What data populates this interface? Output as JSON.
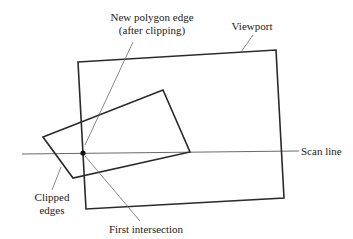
{
  "diagram": {
    "colors": {
      "background": "#ffffff",
      "stroke_heavy": "#2a2a2a",
      "stroke_light": "#6a6a6a",
      "text": "#222222"
    },
    "viewport": {
      "label": "Viewport",
      "corners": [
        [
          78,
          62
        ],
        [
          276,
          50
        ],
        [
          284,
          198
        ],
        [
          86,
          209
        ]
      ]
    },
    "polygon": {
      "vertices": [
        [
          43,
          137
        ],
        [
          163,
          90
        ],
        [
          190,
          152
        ],
        [
          73,
          178
        ]
      ]
    },
    "scan_line": {
      "label": "Scan line",
      "from": [
        22,
        154
      ],
      "to": [
        299,
        151
      ]
    },
    "first_intersection": {
      "label": "First intersection",
      "point": [
        83,
        153
      ]
    },
    "annotations": {
      "new_edge_line1": "New polygon edge",
      "new_edge_line2": "(after clipping)",
      "viewport": "Viewport",
      "scan_line": "Scan line",
      "clipped_line1": "Clipped",
      "clipped_line2": "edges",
      "first_intersection": "First intersection"
    }
  }
}
